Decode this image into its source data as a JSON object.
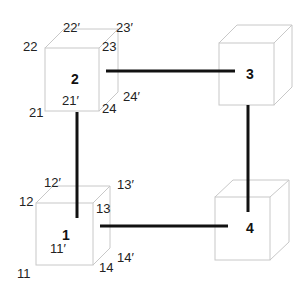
{
  "diagram": {
    "type": "cube-network",
    "colors": {
      "cube_edge": "#c8c8c8",
      "link": "#111111",
      "text": "#222222"
    },
    "cubes": [
      {
        "id": "1",
        "label": "1",
        "corner_labels": [
          "11",
          "11′",
          "12",
          "12′",
          "13",
          "13′",
          "14",
          "14′"
        ]
      },
      {
        "id": "2",
        "label": "2",
        "corner_labels": [
          "21",
          "21′",
          "22",
          "22′",
          "23",
          "23′",
          "24",
          "24′"
        ]
      },
      {
        "id": "3",
        "label": "3",
        "corner_labels": []
      },
      {
        "id": "4",
        "label": "4",
        "corner_labels": []
      }
    ],
    "links": [
      {
        "from": "2",
        "to": "3"
      },
      {
        "from": "2",
        "to": "1"
      },
      {
        "from": "3",
        "to": "4"
      },
      {
        "from": "1",
        "to": "4"
      }
    ]
  }
}
